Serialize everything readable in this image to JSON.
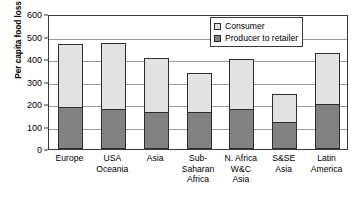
{
  "chart_data": {
    "type": "bar",
    "subtype": "stacked-vertical",
    "title": "",
    "xlabel": "",
    "ylabel": "Per capita food loss kg/yr",
    "ylim": [
      0,
      600
    ],
    "yticks": [
      0,
      100,
      200,
      300,
      400,
      500,
      600
    ],
    "grid": true,
    "legend_position": "top-right",
    "categories": [
      "Europe",
      "USA\nOceania",
      "Asia",
      "Sub-\nSaharan\nAfrica",
      "N. Africa\nW&C\nAsia",
      "S&SE\nAsia",
      "Latin\nAmerica"
    ],
    "series": [
      {
        "name": "Producer to retailer",
        "color": "#828282",
        "values": [
          188,
          178,
          163,
          163,
          178,
          120,
          200
        ]
      },
      {
        "name": "Consumer",
        "color": "#e2e2e2",
        "values": [
          277,
          292,
          242,
          175,
          222,
          125,
          225
        ]
      }
    ],
    "totals": [
      465,
      470,
      405,
      338,
      400,
      245,
      425
    ]
  },
  "legend": {
    "items": [
      {
        "label": "Consumer",
        "swatch": "light-gray-swatch"
      },
      {
        "label": "Producer to retailer",
        "swatch": "dark-gray-swatch"
      }
    ]
  },
  "colors": {
    "consumer": "#e2e2e2",
    "producer": "#828282",
    "axis": "#3a3a3a",
    "grid": "#9a9a9a",
    "background": "#ffffff"
  }
}
